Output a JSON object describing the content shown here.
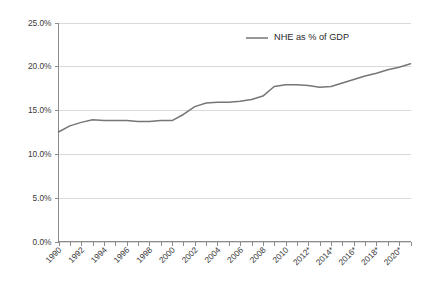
{
  "chart_data": {
    "type": "line",
    "title": "",
    "subtitle": "",
    "xlabel": "",
    "ylabel": "",
    "grid": "horizontal",
    "legend_position": "top-right",
    "ylim": [
      0,
      25
    ],
    "ytick_values": [
      0,
      5,
      10,
      15,
      20,
      25
    ],
    "ytick_labels": [
      "0.0%",
      "5.0%",
      "10.0%",
      "15.0%",
      "20.0%",
      "25.0%"
    ],
    "xlim": [
      1990,
      2021
    ],
    "xtick_labels": [
      "1990",
      "1992",
      "1994",
      "1996",
      "1998",
      "2000",
      "2002",
      "2004",
      "2006",
      "2008",
      "2010",
      "2012*",
      "2014*",
      "2016*",
      "2018*",
      "2020*"
    ],
    "xtick_label_years": [
      1990,
      1992,
      1994,
      1996,
      1998,
      2000,
      2002,
      2004,
      2006,
      2008,
      2010,
      2012,
      2014,
      2016,
      2018,
      2020
    ],
    "xtick_label_rotation": -45,
    "minor_xticks_every_years": 1,
    "series": [
      {
        "name": "NHE as % of GDP",
        "color": "#767676",
        "x": [
          1990,
          1991,
          1992,
          1993,
          1994,
          1995,
          1996,
          1997,
          1998,
          1999,
          2000,
          2001,
          2002,
          2003,
          2004,
          2005,
          2006,
          2007,
          2008,
          2009,
          2010,
          2011,
          2012,
          2013,
          2014,
          2015,
          2016,
          2017,
          2018,
          2019,
          2020,
          2021
        ],
        "values": [
          12.5,
          13.2,
          13.6,
          13.9,
          13.8,
          13.8,
          13.8,
          13.7,
          13.7,
          13.8,
          13.8,
          14.5,
          15.4,
          15.8,
          15.9,
          15.9,
          16.0,
          16.2,
          16.6,
          17.7,
          17.9,
          17.9,
          17.8,
          17.6,
          17.7,
          18.1,
          18.5,
          18.9,
          19.2,
          19.6,
          19.9,
          20.3
        ]
      }
    ],
    "legend": [
      {
        "label": "NHE as % of GDP",
        "color": "#767676"
      }
    ],
    "footnote": ""
  },
  "accent_colors": {
    "series": "#767676",
    "gridline": "#d9d9d9",
    "axis": "#8c8c8c",
    "tick_text": "#3a3a3a",
    "background": "#ffffff"
  }
}
